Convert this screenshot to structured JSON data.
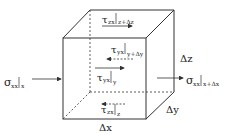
{
  "diagram": {
    "type": "control-volume-cube",
    "colors": {
      "stroke": "#333333",
      "text": "#222222",
      "background": "#ffffff"
    },
    "labels": {
      "sigma_left": {
        "symbol": "σ",
        "sub": "xx",
        "eval": "x"
      },
      "sigma_right": {
        "symbol": "σ",
        "sub": "xx",
        "eval": "x+Δx"
      },
      "tau_top": {
        "symbol": "τ",
        "sub": "zx",
        "eval": "z+Δz"
      },
      "tau_y_far": {
        "symbol": "τ",
        "sub": "yx",
        "eval": "y+Δy"
      },
      "tau_y_near": {
        "symbol": "τ",
        "sub": "yx",
        "eval": "y"
      },
      "tau_bottom": {
        "symbol": "τ",
        "sub": "zx",
        "eval": "z"
      },
      "dx": "Δx",
      "dy": "Δy",
      "dz": "Δz"
    }
  }
}
